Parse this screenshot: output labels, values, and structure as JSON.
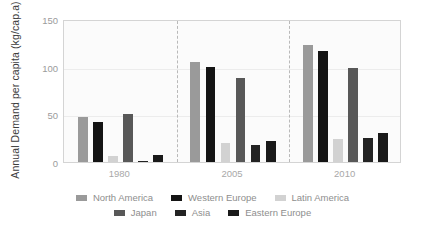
{
  "chart_data": {
    "type": "bar",
    "title": "",
    "xlabel": "",
    "ylabel": "Annual Demand per capita (kg/cap.a)",
    "categories": [
      "1980",
      "2005",
      "2010"
    ],
    "ylim": [
      0,
      150
    ],
    "yticks": [
      0,
      50,
      100,
      150
    ],
    "ytick_labels": [
      "0",
      "50",
      "100",
      "150"
    ],
    "grid": true,
    "legend_position": "bottom",
    "series": [
      {
        "name": "North America",
        "color": "#9a9a9a",
        "values": [
          47,
          105,
          123
        ]
      },
      {
        "name": "Western Europe",
        "color": "#141414",
        "values": [
          42,
          100,
          116
        ]
      },
      {
        "name": "Latin America",
        "color": "#d2d2d2",
        "values": [
          6,
          20,
          24
        ]
      },
      {
        "name": "Japan",
        "color": "#585858",
        "values": [
          50,
          88,
          99
        ]
      },
      {
        "name": "Asia",
        "color": "#232323",
        "values": [
          1.5,
          18,
          25
        ]
      },
      {
        "name": "Eastern Europe",
        "color": "#1a1a1a",
        "values": [
          7,
          22,
          30
        ]
      }
    ]
  },
  "legend": {
    "rows": [
      [
        {
          "label": "North America",
          "color": "#9a9a9a"
        },
        {
          "label": "Western Europe",
          "color": "#141414"
        },
        {
          "label": "Latin America",
          "color": "#d2d2d2"
        }
      ],
      [
        {
          "label": "Japan",
          "color": "#585858"
        },
        {
          "label": "Asia",
          "color": "#232323"
        },
        {
          "label": "Eastern Europe",
          "color": "#1a1a1a"
        }
      ]
    ]
  },
  "colors": {
    "background": "#ffffff",
    "plot_background": "#fbfbfb",
    "frame": "#d4d4d4",
    "gridline": "#ececec",
    "separator": "#b9b9b9",
    "tick_text": "#9b9b9b",
    "axis_title": "#3d3d3d",
    "legend_text": "#8e8e8e"
  }
}
